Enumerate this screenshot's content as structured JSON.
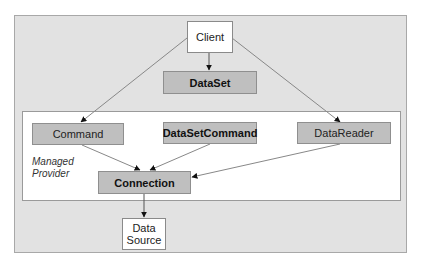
{
  "diagram": {
    "type": "architecture",
    "container": {
      "label": "Managed Provider"
    },
    "nodes": [
      {
        "id": "client",
        "label": "Client",
        "style": "white"
      },
      {
        "id": "dataset",
        "label": "DataSet",
        "style": "gray-bold"
      },
      {
        "id": "command",
        "label": "Command",
        "style": "gray"
      },
      {
        "id": "datasetcommand",
        "label": "DataSetCommand",
        "style": "gray-bold"
      },
      {
        "id": "datareader",
        "label": "DataReader",
        "style": "gray"
      },
      {
        "id": "connection",
        "label": "Connection",
        "style": "gray-bold"
      },
      {
        "id": "datasource",
        "label": "Data Source",
        "line1": "Data",
        "line2": "Source",
        "style": "white"
      }
    ],
    "edges": [
      {
        "from": "client",
        "to": "dataset"
      },
      {
        "from": "client",
        "to": "command"
      },
      {
        "from": "client",
        "to": "datareader"
      },
      {
        "from": "command",
        "to": "connection"
      },
      {
        "from": "datasetcommand",
        "to": "connection"
      },
      {
        "from": "datareader",
        "to": "connection"
      },
      {
        "from": "connection",
        "to": "datasource"
      }
    ],
    "colors": {
      "outer_background": "#e2e2e2",
      "inner_background": "#ffffff",
      "gray_node": "#bfbfbf",
      "edge": "#777777"
    }
  }
}
